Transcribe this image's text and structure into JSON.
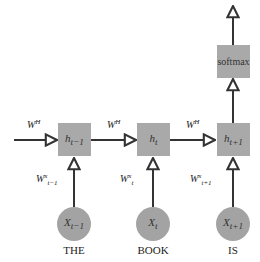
{
  "diagram": {
    "type": "rnn-unrolled",
    "output_node": {
      "label": "softmax"
    },
    "hidden_nodes": [
      {
        "label": "h",
        "sub": "t−1"
      },
      {
        "label": "h",
        "sub": "t"
      },
      {
        "label": "h",
        "sub": "t+1"
      }
    ],
    "input_nodes": [
      {
        "label": "X",
        "sub": "t−1",
        "word": "THE"
      },
      {
        "label": "X",
        "sub": "t",
        "word": "BOOK"
      },
      {
        "label": "X",
        "sub": "t+1",
        "word": "IS"
      }
    ],
    "recurrent_weights": [
      {
        "label": "W",
        "sup": "H"
      },
      {
        "label": "W",
        "sup": "H"
      },
      {
        "label": "W",
        "sup": "H"
      }
    ],
    "input_weights": [
      {
        "label": "W",
        "sup": "x",
        "sub": "t−1"
      },
      {
        "label": "W",
        "sup": "x",
        "sub": "t"
      },
      {
        "label": "W",
        "sup": "x",
        "sub": "t+1"
      }
    ],
    "colors": {
      "node_fill": "#a9a9a9",
      "line": "#333333",
      "background": "#ffffff"
    }
  }
}
